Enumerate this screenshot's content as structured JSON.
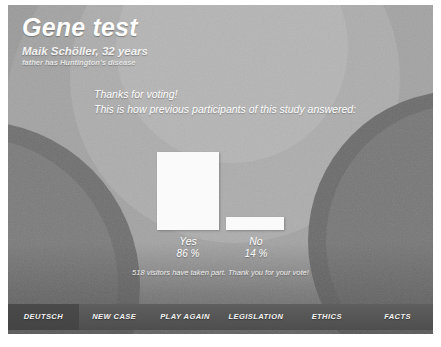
{
  "header": {
    "title": "Gene test",
    "patient_name": "Maik Schöller, 32 years",
    "patient_condition": "father has Huntington's disease"
  },
  "intro": {
    "line1": "Thanks for voting!",
    "line2": "This is how previous participants of this study answered:"
  },
  "chart_data": {
    "type": "bar",
    "title": "",
    "xlabel": "",
    "ylabel": "",
    "categories": [
      "Yes",
      "No"
    ],
    "values": [
      86,
      14
    ],
    "value_labels": [
      "86 %",
      "14 %"
    ],
    "unit": "%",
    "ylim": [
      0,
      100
    ],
    "grid": false,
    "legend": "none",
    "bar_color": "#fafafa",
    "annotation": "518 visitors have taken part. Thank you for your vote!"
  },
  "footer_note": "518 visitors have taken part. Thank you for your vote!",
  "nav": {
    "buttons": [
      {
        "label": "DEUTSCH"
      },
      {
        "label": "NEW CASE"
      },
      {
        "label": "PLAY AGAIN"
      },
      {
        "label": "LEGISLATION"
      },
      {
        "label": "ETHICS"
      },
      {
        "label": "FACTS"
      }
    ]
  },
  "colors": {
    "bar": "#fafafa",
    "text": "#ffffff",
    "nav_bar": "#565656",
    "background": "#8e8e8e"
  }
}
